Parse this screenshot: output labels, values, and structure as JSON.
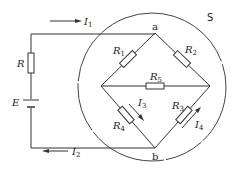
{
  "diagram": {
    "type": "circuit",
    "surface_label": "S",
    "nodes": {
      "top": "a",
      "bottom": "b"
    },
    "source": {
      "label": "E"
    },
    "series_resistor": {
      "label": "R"
    },
    "bridge_resistors": [
      {
        "id": "R1",
        "base": "R",
        "sub": "1",
        "branch": "a-left"
      },
      {
        "id": "R2",
        "base": "R",
        "sub": "2",
        "branch": "a-right"
      },
      {
        "id": "R3",
        "base": "R",
        "sub": "3",
        "branch": "right-b"
      },
      {
        "id": "R4",
        "base": "R",
        "sub": "4",
        "branch": "left-b"
      },
      {
        "id": "R5",
        "base": "R",
        "sub": "5",
        "branch": "left-right"
      }
    ],
    "currents": [
      {
        "id": "I1",
        "base": "I",
        "sub": "1",
        "direction": "right",
        "location": "top wire"
      },
      {
        "id": "I2",
        "base": "I",
        "sub": "2",
        "direction": "left",
        "location": "bottom wire"
      },
      {
        "id": "I3",
        "base": "I",
        "sub": "3",
        "direction": "down-right",
        "location": "along R4"
      },
      {
        "id": "I4",
        "base": "I",
        "sub": "4",
        "direction": "up-right",
        "location": "along R3"
      }
    ]
  }
}
